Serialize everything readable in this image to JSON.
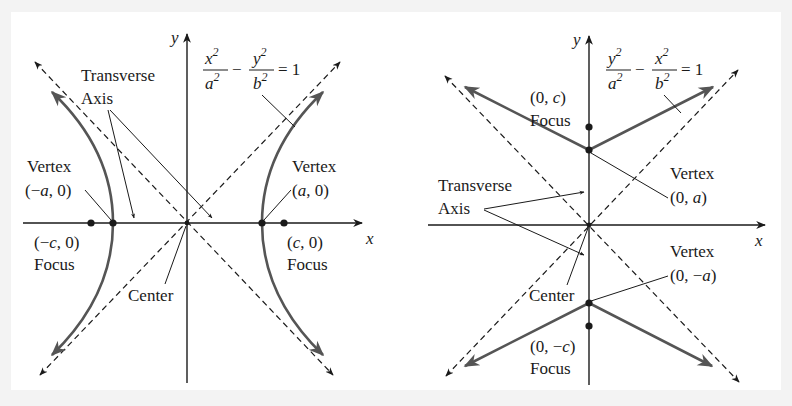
{
  "colors": {
    "background": "#f3f3f3",
    "panel": "#ffffff",
    "ink": "#1a1a1a",
    "curve": "#555555"
  },
  "left": {
    "axis_x": "x",
    "axis_y": "y",
    "equation": {
      "num1": "x",
      "den1": "a",
      "num2": "y",
      "den2": "b",
      "exp": "2",
      "minus": "−",
      "rhs": "= 1"
    },
    "transverse": {
      "line1": "Transverse",
      "line2": "Axis"
    },
    "vertex_left": {
      "label": "Vertex",
      "coord_open": "(−",
      "coord_var": "a",
      "coord_close": ", 0)"
    },
    "vertex_right": {
      "label": "Vertex",
      "coord_open": "(",
      "coord_var": "a",
      "coord_close": ", 0)"
    },
    "focus_left": {
      "coord_open": "(−",
      "coord_var": "c",
      "coord_close": ", 0)",
      "label": "Focus"
    },
    "focus_right": {
      "coord_open": "(",
      "coord_var": "c",
      "coord_close": ", 0)",
      "label": "Focus"
    },
    "center": "Center"
  },
  "right": {
    "axis_x": "x",
    "axis_y": "y",
    "equation": {
      "num1": "y",
      "den1": "a",
      "num2": "x",
      "den2": "b",
      "exp": "2",
      "minus": "−",
      "rhs": "= 1"
    },
    "transverse": {
      "line1": "Transverse",
      "line2": "Axis"
    },
    "focus_top": {
      "coord_open": "(0, ",
      "coord_var": "c",
      "coord_close": ")",
      "label": "Focus"
    },
    "focus_bottom": {
      "coord_open": "(0, −",
      "coord_var": "c",
      "coord_close": ")",
      "label": "Focus"
    },
    "vertex_top": {
      "label": "Vertex",
      "coord_open": "(0, ",
      "coord_var": "a",
      "coord_close": ")"
    },
    "vertex_bottom": {
      "label": "Vertex",
      "coord_open": "(0, −",
      "coord_var": "a",
      "coord_close": ")"
    },
    "center": "Center"
  }
}
